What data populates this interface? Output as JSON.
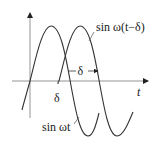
{
  "diagram": {
    "title": "",
    "colors": {
      "curve": "#333333",
      "axis": "#888888",
      "axis_arrow": "#222222",
      "text": "#1a1a1a",
      "background": "#ffffff"
    },
    "axes": {
      "x_label": "t",
      "y_label": ""
    },
    "curves": [
      {
        "name": "sin-wt",
        "label": "sin ωt"
      },
      {
        "name": "sin-w-t-minus-delta",
        "label": "sin ω(t−δ)"
      }
    ],
    "annotations": {
      "delta_axis_label": "δ",
      "delta_span_label": "δ"
    }
  }
}
